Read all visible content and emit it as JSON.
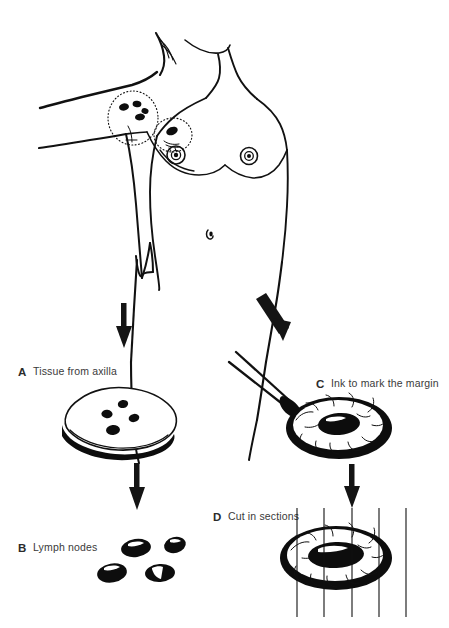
{
  "figure": {
    "background_color": "#ffffff",
    "ink_color": "#111111"
  },
  "panels": [
    {
      "letter": "A",
      "label": "Tissue from axilla",
      "letter_x": 18,
      "letter_y": 376,
      "text_x": 33,
      "text_y": 375,
      "node_count": 4
    },
    {
      "letter": "B",
      "label": "Lymph nodes",
      "letter_x": 18,
      "letter_y": 552,
      "text_x": 33,
      "text_y": 551,
      "node_count": 4
    },
    {
      "letter": "C",
      "label": "Ink to mark the margin",
      "letter_x": 316,
      "letter_y": 388,
      "text_x": 331,
      "text_y": 387,
      "node_count": 1
    },
    {
      "letter": "D",
      "label": "Cut in sections",
      "letter_x": 213,
      "letter_y": 521,
      "text_x": 228,
      "text_y": 520,
      "section_count": 5
    }
  ],
  "anatomy": {
    "axilla_marker": "dotted-circle-with-lymph-nodes",
    "axilla_node_count": 4,
    "tumor_marker": "dotted-circle-with-tumor",
    "nipple_left": "areola-left",
    "nipple_right": "areola-right",
    "umbilicus": "navel"
  },
  "arrows": [
    {
      "name": "arrow-body-to-axilla-tissue",
      "direction": "down"
    },
    {
      "name": "arrow-body-to-ink-specimen",
      "direction": "down-right"
    },
    {
      "name": "arrow-tissue-to-lymph-nodes",
      "direction": "down"
    },
    {
      "name": "arrow-ink-to-sections",
      "direction": "down"
    }
  ],
  "instruments": {
    "applicator": "ink-applicator-brush"
  }
}
